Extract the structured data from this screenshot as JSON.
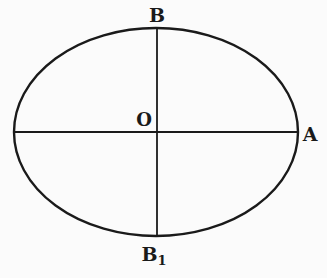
{
  "figure": {
    "type": "ellipse-axes-diagram",
    "colors": {
      "ink": "#1a1a1a",
      "paper": "#fbfbfb"
    },
    "ellipse": {
      "cx": 156,
      "cy": 132,
      "rx": 143,
      "ry": 104
    },
    "labels": {
      "top": "B",
      "center": "O",
      "right": "A",
      "bottom": "B",
      "bottom_subscript": "1"
    }
  }
}
